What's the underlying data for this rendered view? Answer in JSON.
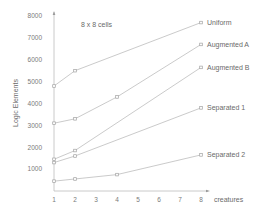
{
  "chart_data": {
    "type": "line",
    "title": "",
    "annotation": "8 x 8 cells",
    "xlabel": "creatures",
    "ylabel": "Logic Elements",
    "xlim": [
      1,
      8
    ],
    "ylim": [
      0,
      8000
    ],
    "x_ticks": [
      "1",
      "2",
      "3",
      "4",
      "5",
      "6",
      "7",
      "8"
    ],
    "y_ticks": [
      "1000",
      "2000",
      "3000",
      "4000",
      "5000",
      "6000",
      "7000",
      "8000"
    ],
    "grid": false,
    "legend": "inline-right",
    "series": [
      {
        "name": "Uniform",
        "x": [
          1,
          2,
          8
        ],
        "values": [
          4800,
          5500,
          7700
        ]
      },
      {
        "name": "Augmented A",
        "x": [
          1,
          2,
          4,
          8
        ],
        "values": [
          3100,
          3300,
          4300,
          6700
        ]
      },
      {
        "name": "Augmented B",
        "x": [
          1,
          2,
          8
        ],
        "values": [
          1450,
          1850,
          5650
        ]
      },
      {
        "name": "Separated 1",
        "x": [
          1,
          2,
          8
        ],
        "values": [
          1300,
          1600,
          3800
        ]
      },
      {
        "name": "Separated 2",
        "x": [
          1,
          2,
          4,
          8
        ],
        "values": [
          450,
          550,
          750,
          1650
        ]
      }
    ]
  }
}
